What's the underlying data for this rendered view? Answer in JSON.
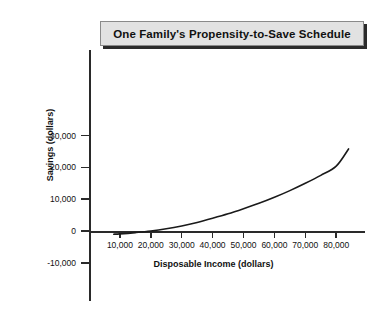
{
  "title": {
    "text": "One Family's Propensity-to-Save Schedule"
  },
  "colors": {
    "background": "#ffffff",
    "axis": "#2a2a2a",
    "curve": "#1a1a1a",
    "title_fill": "#e2e2e2",
    "title_border": "#8a8a8a",
    "title_shadow": "#2b2b2b",
    "text": "#111111"
  },
  "chart_data": {
    "type": "line",
    "title": "One Family's Propensity-to-Save Schedule",
    "xlabel": "Disposable Income (dollars)",
    "ylabel": "Savings (dollars)",
    "grid": false,
    "legend": null,
    "xlim": [
      0,
      89000
    ],
    "ylim": [
      -15000,
      40000
    ],
    "xticks": [
      10000,
      20000,
      30000,
      40000,
      50000,
      60000,
      70000,
      80000
    ],
    "xticklabels": [
      "10,000",
      "20,000",
      "30,000",
      "40,000",
      "50,000",
      "60,000",
      "70,000",
      "80,000"
    ],
    "yticks": [
      -10000,
      0,
      10000,
      20000,
      30000
    ],
    "yticklabels": [
      "-10,000",
      "0",
      "10,000",
      "20,000",
      "30,000"
    ],
    "series": [
      {
        "name": "Savings",
        "x": [
          8000,
          10000,
          15000,
          20000,
          25000,
          30000,
          35000,
          40000,
          45000,
          50000,
          55000,
          60000,
          65000,
          70000,
          75000,
          80000,
          84000
        ],
        "y": [
          -1000,
          -900,
          -500,
          0,
          700,
          1600,
          2700,
          4000,
          5400,
          7000,
          8700,
          10600,
          12700,
          15000,
          17500,
          20400,
          25800
        ]
      }
    ],
    "annotations": []
  }
}
